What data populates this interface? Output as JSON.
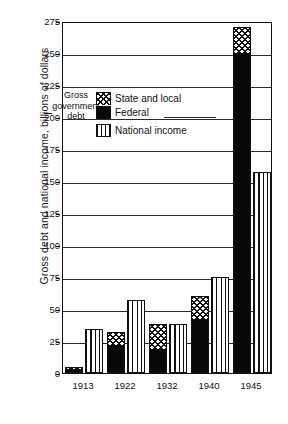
{
  "chart_data": {
    "type": "bar",
    "title": "",
    "xlabel": "",
    "ylabel": "Gross debt and national income, billions of dollars",
    "ylim": [
      0,
      275
    ],
    "ytick_step": 25,
    "yticks": [
      0,
      25,
      50,
      75,
      100,
      125,
      150,
      175,
      200,
      225,
      250,
      275
    ],
    "ytick_labels": [
      "0",
      "25",
      "50",
      "75",
      "100",
      "125",
      "150",
      "175",
      "200",
      "225",
      "250",
      "275"
    ],
    "categories": [
      "1913",
      "1922",
      "1932",
      "1940",
      "1945"
    ],
    "grid": true,
    "legend_position": "upper-left-inside",
    "series": [
      {
        "name": "Federal",
        "stack": "debt",
        "values": [
          2,
          21,
          18,
          42,
          250
        ]
      },
      {
        "name": "State and local",
        "stack": "debt",
        "values": [
          3,
          11,
          20,
          18,
          20
        ]
      },
      {
        "name": "National income",
        "stack": "income",
        "values": [
          34,
          57,
          38,
          75,
          157
        ]
      }
    ],
    "stack_totals": {
      "gross_government_debt": [
        5,
        32,
        38,
        60,
        270
      ]
    },
    "annotations": [
      {
        "text": "Gross government debt",
        "target": "debt-bars"
      }
    ]
  },
  "legend": {
    "items": [
      {
        "label": "State and local",
        "swatch": "checker-hatch"
      },
      {
        "label": "Federal",
        "swatch": "solid-black"
      },
      {
        "label": "National income",
        "swatch": "vertical-lines"
      }
    ]
  },
  "annotation": {
    "line1": "Gross",
    "line2": "government",
    "line3": "debt"
  }
}
